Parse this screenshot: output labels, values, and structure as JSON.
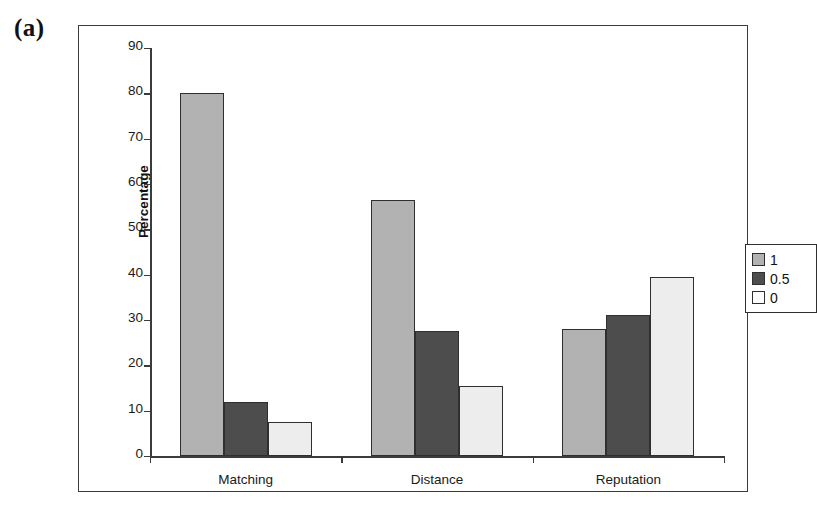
{
  "figure": {
    "label": "(a)"
  },
  "chart_data": {
    "type": "bar",
    "title": "",
    "xlabel": "",
    "ylabel": "Percentage",
    "ylim": [
      0,
      90
    ],
    "yticks": [
      0,
      10,
      20,
      30,
      40,
      50,
      60,
      70,
      80,
      90
    ],
    "ytick_labels": [
      "0",
      "10",
      "20",
      "30",
      "40",
      "50",
      "60",
      "70",
      "80",
      "90"
    ],
    "grid": false,
    "legend_position": "right",
    "categories": [
      "Matching",
      "Distance",
      "Reputation"
    ],
    "series": [
      {
        "name": "1",
        "color": "#b2b2b2",
        "values": [
          80.0,
          56.5,
          28.0
        ]
      },
      {
        "name": "0.5",
        "color": "#4d4d4d",
        "values": [
          12.0,
          27.5,
          31.0
        ]
      },
      {
        "name": "0",
        "color": "#ededed",
        "values": [
          7.5,
          15.5,
          39.5
        ]
      }
    ]
  },
  "legend": {
    "items": [
      {
        "label": "1"
      },
      {
        "label": "0.5"
      },
      {
        "label": "0"
      }
    ]
  }
}
